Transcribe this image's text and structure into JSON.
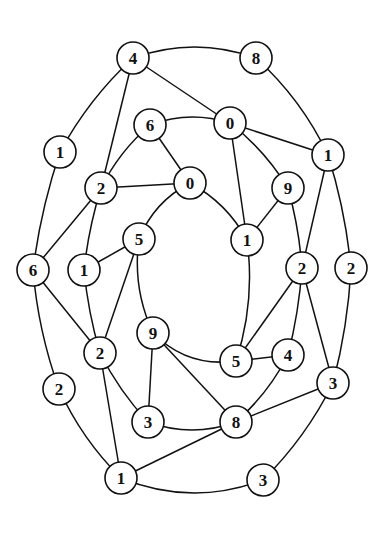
{
  "diagram": {
    "type": "graph",
    "style": {
      "stroke": "#111111",
      "node_fill": "#ffffff",
      "background": "#ffffff",
      "node_radius": 16
    },
    "nodes": [
      {
        "id": "o4",
        "label": "4",
        "x": 133,
        "y": 58
      },
      {
        "id": "o8",
        "label": "8",
        "x": 256,
        "y": 58
      },
      {
        "id": "o1a",
        "label": "1",
        "x": 328,
        "y": 155
      },
      {
        "id": "o2a",
        "label": "2",
        "x": 351,
        "y": 268
      },
      {
        "id": "o3a",
        "label": "3",
        "x": 333,
        "y": 383
      },
      {
        "id": "o3b",
        "label": "3",
        "x": 263,
        "y": 480
      },
      {
        "id": "o1b",
        "label": "1",
        "x": 121,
        "y": 478
      },
      {
        "id": "o2b",
        "label": "2",
        "x": 59,
        "y": 389
      },
      {
        "id": "o6",
        "label": "6",
        "x": 33,
        "y": 270
      },
      {
        "id": "o1c",
        "label": "1",
        "x": 60,
        "y": 152
      },
      {
        "id": "m6",
        "label": "6",
        "x": 150,
        "y": 125
      },
      {
        "id": "m0",
        "label": "0",
        "x": 230,
        "y": 123
      },
      {
        "id": "m9",
        "label": "9",
        "x": 288,
        "y": 188
      },
      {
        "id": "m2r",
        "label": "2",
        "x": 302,
        "y": 268
      },
      {
        "id": "m4",
        "label": "4",
        "x": 288,
        "y": 355
      },
      {
        "id": "m8",
        "label": "8",
        "x": 236,
        "y": 422
      },
      {
        "id": "m3",
        "label": "3",
        "x": 148,
        "y": 422
      },
      {
        "id": "m2l",
        "label": "2",
        "x": 100,
        "y": 353
      },
      {
        "id": "m1",
        "label": "1",
        "x": 84,
        "y": 270
      },
      {
        "id": "m2t",
        "label": "2",
        "x": 101,
        "y": 188
      },
      {
        "id": "i0",
        "label": "0",
        "x": 190,
        "y": 183
      },
      {
        "id": "i1",
        "label": "1",
        "x": 247,
        "y": 240
      },
      {
        "id": "i5r",
        "label": "5",
        "x": 236,
        "y": 361
      },
      {
        "id": "i9",
        "label": "9",
        "x": 153,
        "y": 333
      },
      {
        "id": "i5l",
        "label": "5",
        "x": 139,
        "y": 239
      }
    ],
    "edges": [
      {
        "from": "o4",
        "to": "o8",
        "curve": -22
      },
      {
        "from": "o8",
        "to": "o1a",
        "curve": -12
      },
      {
        "from": "o1a",
        "to": "o2a",
        "curve": -6
      },
      {
        "from": "o2a",
        "to": "o3a",
        "curve": -6
      },
      {
        "from": "o3a",
        "to": "o3b",
        "curve": -10
      },
      {
        "from": "o3b",
        "to": "o1b",
        "curve": -28
      },
      {
        "from": "o1b",
        "to": "o2b",
        "curve": -10
      },
      {
        "from": "o2b",
        "to": "o6",
        "curve": -8
      },
      {
        "from": "o6",
        "to": "o1c",
        "curve": -6
      },
      {
        "from": "o1c",
        "to": "o4",
        "curve": -10
      },
      {
        "from": "o4",
        "to": "m0",
        "curve": 0
      },
      {
        "from": "o4",
        "to": "m2t",
        "curve": 0
      },
      {
        "from": "o1a",
        "to": "m0",
        "curve": 0
      },
      {
        "from": "o1a",
        "to": "m2r",
        "curve": 0
      },
      {
        "from": "o6",
        "to": "m2t",
        "curve": 0
      },
      {
        "from": "o6",
        "to": "m2l",
        "curve": 0
      },
      {
        "from": "o3a",
        "to": "m2r",
        "curve": 0
      },
      {
        "from": "o3a",
        "to": "m8",
        "curve": 0
      },
      {
        "from": "o1b",
        "to": "m2l",
        "curve": 0
      },
      {
        "from": "o1b",
        "to": "m8",
        "curve": 0
      },
      {
        "from": "m6",
        "to": "m0",
        "curve": -14
      },
      {
        "from": "m0",
        "to": "m9",
        "curve": -8
      },
      {
        "from": "m9",
        "to": "m2r",
        "curve": -4
      },
      {
        "from": "m2r",
        "to": "m4",
        "curve": -4
      },
      {
        "from": "m4",
        "to": "m8",
        "curve": -8
      },
      {
        "from": "m8",
        "to": "m3",
        "curve": -16
      },
      {
        "from": "m3",
        "to": "m2l",
        "curve": -6
      },
      {
        "from": "m2l",
        "to": "m1",
        "curve": -4
      },
      {
        "from": "m1",
        "to": "m2t",
        "curve": -4
      },
      {
        "from": "m2t",
        "to": "m6",
        "curve": -8
      },
      {
        "from": "m6",
        "to": "i0",
        "curve": 0
      },
      {
        "from": "m2t",
        "to": "i0",
        "curve": 0
      },
      {
        "from": "m0",
        "to": "i1",
        "curve": 0
      },
      {
        "from": "m9",
        "to": "i1",
        "curve": 0
      },
      {
        "from": "m2r",
        "to": "i5r",
        "curve": 0
      },
      {
        "from": "m4",
        "to": "i5r",
        "curve": 0
      },
      {
        "from": "m8",
        "to": "i9",
        "curve": 0
      },
      {
        "from": "m3",
        "to": "i9",
        "curve": 0
      },
      {
        "from": "m2l",
        "to": "i5l",
        "curve": 0
      },
      {
        "from": "m1",
        "to": "i5l",
        "curve": 0
      },
      {
        "from": "i0",
        "to": "i1",
        "curve": -12
      },
      {
        "from": "i1",
        "to": "i5r",
        "curve": -14
      },
      {
        "from": "i5r",
        "to": "i9",
        "curve": -22
      },
      {
        "from": "i9",
        "to": "i5l",
        "curve": -14
      },
      {
        "from": "i5l",
        "to": "i0",
        "curve": -14
      }
    ]
  }
}
